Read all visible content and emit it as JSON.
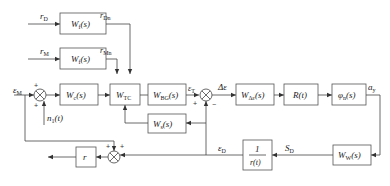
{
  "diagram": {
    "type": "block-diagram",
    "blocks": [
      {
        "id": "Wf1",
        "label": "W",
        "sub": "f",
        "arg": "(s)"
      },
      {
        "id": "Wf2",
        "label": "W",
        "sub": "f",
        "arg": "(s)"
      },
      {
        "id": "Wc",
        "label": "W",
        "sub": "c",
        "arg": "(s)"
      },
      {
        "id": "WTC",
        "label": "W",
        "sub": "TC",
        "arg": ""
      },
      {
        "id": "WBG",
        "label": "W",
        "sub": "BG",
        "arg": "(s)"
      },
      {
        "id": "Ws",
        "label": "W",
        "sub": "s",
        "arg": "(s)"
      },
      {
        "id": "WDe",
        "label": "W",
        "sub": "Δε",
        "arg": "(s)"
      },
      {
        "id": "R",
        "label": "R(t)",
        "sub": "",
        "arg": ""
      },
      {
        "id": "phi",
        "label": "φ",
        "sub": "n",
        "arg": "(s)"
      },
      {
        "id": "r",
        "label": "r",
        "sub": "",
        "arg": ""
      },
      {
        "id": "inv",
        "label_num": "1",
        "label_den": "r(t)"
      },
      {
        "id": "WW",
        "label": "W",
        "sub": "W",
        "arg": "(s)"
      }
    ],
    "signals": {
      "rD": {
        "main": "r",
        "sub": "D"
      },
      "rDn": {
        "main": "r",
        "sub": "Dn"
      },
      "rM": {
        "main": "r",
        "sub": "M"
      },
      "rMn": {
        "main": "r",
        "sub": "Mn"
      },
      "epsM": {
        "main": "ε",
        "sub": "M"
      },
      "n1": {
        "main": "n",
        "sub": "1",
        "arg": "(t)"
      },
      "epsT": {
        "main": "ε",
        "sub": "T"
      },
      "deltaEps": {
        "main": "Δε",
        "sub": ""
      },
      "ay": {
        "main": "a",
        "sub": "y"
      },
      "epsD": {
        "main": "ε",
        "sub": "D"
      },
      "SD": {
        "main": "S",
        "sub": "D"
      }
    },
    "signs": {
      "sum1_top": "+",
      "sum1_bottom": "+",
      "sum2_left": "+",
      "sum2_bottom": "−",
      "sum3_left": "+",
      "sum3_right": "+"
    }
  }
}
